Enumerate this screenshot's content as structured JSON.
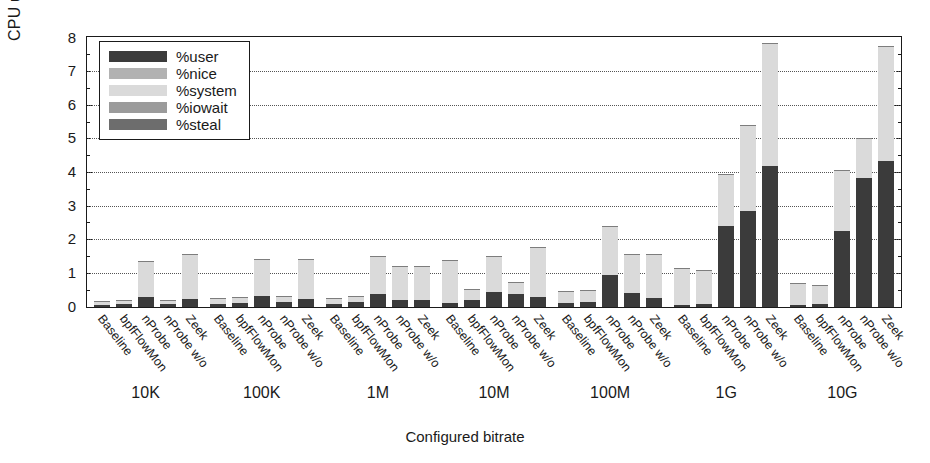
{
  "chart_data": {
    "type": "bar",
    "title": "",
    "xlabel": "Configured bitrate",
    "ylabel": "CPU usage [%]",
    "ylim": [
      0,
      8
    ],
    "yticks": [
      0,
      1,
      2,
      3,
      4,
      5,
      6,
      7,
      8
    ],
    "grid": true,
    "stacked": true,
    "legend_position": "top-left",
    "categories": [
      "10K",
      "100K",
      "1M",
      "10M",
      "100M",
      "1G",
      "10G"
    ],
    "subcategories": [
      "Baseline",
      "bpfFlowMon",
      "nProbe",
      "nProbe w/o",
      "Zeek"
    ],
    "series": [
      {
        "name": "%user",
        "color": "#3b3b3b",
        "values": [
          [
            0.06,
            0.09,
            0.3,
            0.1,
            0.22
          ],
          [
            0.1,
            0.13,
            0.33,
            0.15,
            0.22
          ],
          [
            0.1,
            0.14,
            0.38,
            0.2,
            0.2
          ],
          [
            0.12,
            0.22,
            0.43,
            0.4,
            0.3
          ],
          [
            0.12,
            0.13,
            0.95,
            0.4,
            0.25
          ],
          [
            0.05,
            0.07,
            2.4,
            2.85,
            4.2
          ],
          [
            0.05,
            0.07,
            2.25,
            3.85,
            4.35
          ]
        ]
      },
      {
        "name": "%nice",
        "color": "#b2b2b2",
        "values": [
          [
            0,
            0,
            0,
            0,
            0
          ],
          [
            0,
            0,
            0,
            0,
            0
          ],
          [
            0,
            0,
            0,
            0,
            0
          ],
          [
            0,
            0,
            0,
            0,
            0
          ],
          [
            0,
            0,
            0,
            0,
            0
          ],
          [
            0,
            0,
            0,
            0,
            0
          ],
          [
            0,
            0,
            0,
            0,
            0
          ]
        ]
      },
      {
        "name": "%system",
        "color": "#dadada",
        "values": [
          [
            0.09,
            0.11,
            1.05,
            0.1,
            1.33
          ],
          [
            0.15,
            0.15,
            1.09,
            0.15,
            1.2
          ],
          [
            0.15,
            0.16,
            1.12,
            1.0,
            1.0
          ],
          [
            1.26,
            0.3,
            1.07,
            0.32,
            1.48
          ],
          [
            0.33,
            0.37,
            1.45,
            1.15,
            1.3
          ],
          [
            1.1,
            1.01,
            1.55,
            2.55,
            3.65
          ],
          [
            0.65,
            0.58,
            1.8,
            1.15,
            3.4
          ]
        ]
      },
      {
        "name": "%iowait",
        "color": "#9b9b9b",
        "values": [
          [
            0,
            0,
            0,
            0,
            0
          ],
          [
            0,
            0,
            0,
            0,
            0
          ],
          [
            0,
            0,
            0,
            0,
            0
          ],
          [
            0,
            0,
            0,
            0,
            0
          ],
          [
            0,
            0,
            0,
            0,
            0
          ],
          [
            0,
            0,
            0,
            0,
            0
          ],
          [
            0,
            0,
            0,
            0,
            0
          ]
        ]
      },
      {
        "name": "%steal",
        "color": "#6d6d6d",
        "values": [
          [
            0,
            0,
            0,
            0,
            0
          ],
          [
            0,
            0,
            0,
            0,
            0
          ],
          [
            0,
            0,
            0,
            0,
            0
          ],
          [
            0,
            0,
            0,
            0,
            0
          ],
          [
            0,
            0,
            0,
            0,
            0
          ],
          [
            0,
            0,
            0,
            0,
            0
          ],
          [
            0,
            0,
            0,
            0,
            0
          ]
        ]
      }
    ],
    "totals": [
      [
        0.15,
        0.2,
        1.35,
        0.2,
        1.55
      ],
      [
        0.25,
        0.28,
        1.42,
        0.3,
        1.42
      ],
      [
        0.25,
        0.3,
        1.5,
        1.2,
        1.2
      ],
      [
        1.38,
        0.52,
        1.5,
        0.72,
        1.78
      ],
      [
        0.45,
        0.5,
        2.4,
        1.55,
        1.55
      ],
      [
        1.15,
        1.08,
        3.95,
        5.4,
        7.85
      ],
      [
        0.7,
        0.65,
        4.05,
        5.0,
        7.75
      ]
    ]
  },
  "legend": {
    "items": [
      {
        "label": "%user"
      },
      {
        "label": "%nice"
      },
      {
        "label": "%system"
      },
      {
        "label": "%iowait"
      },
      {
        "label": "%steal"
      }
    ]
  }
}
